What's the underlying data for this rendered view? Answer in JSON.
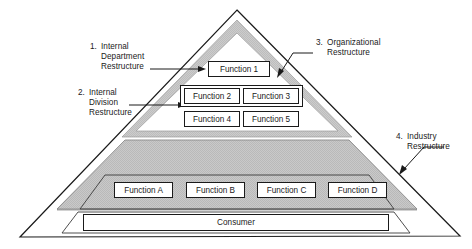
{
  "diagram": {
    "colors": {
      "outline": "#1a1a1a",
      "band_gray": "#c9c9c9",
      "base_gray": "#c4c4c4",
      "box_fill": "#ffffff"
    },
    "callouts": [
      {
        "number": "1.",
        "line1": "Internal",
        "line2": "Department",
        "line3": "Restructure"
      },
      {
        "number": "2.",
        "line1": "Internal",
        "line2": "Division",
        "line3": "Restructure"
      },
      {
        "number": "3.",
        "line1": "Organizational",
        "line2": "Restructure",
        "line3": ""
      },
      {
        "number": "4.",
        "line1": "Industry",
        "line2": "Restructure",
        "line3": ""
      }
    ],
    "upper_functions": [
      {
        "label": "Function 1"
      },
      {
        "label": "Function 2"
      },
      {
        "label": "Function 3"
      },
      {
        "label": "Function 4"
      },
      {
        "label": "Function 5"
      }
    ],
    "lower_functions": [
      {
        "label": "Function A"
      },
      {
        "label": "Function B"
      },
      {
        "label": "Function C"
      },
      {
        "label": "Function D"
      }
    ],
    "consumer": {
      "label": "Consumer"
    }
  }
}
